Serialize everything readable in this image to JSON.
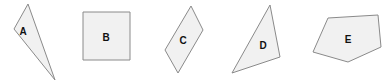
{
  "diagram": {
    "colors": {
      "fill": "#f1f1f1",
      "stroke": "#8a8a8a",
      "label": "#111111",
      "background": "#ffffff"
    },
    "shapes": [
      {
        "label": "A",
        "type": "triangle",
        "points": "28,4 14,29 55,80",
        "label_pos": [
          23,
          31
        ]
      },
      {
        "label": "B",
        "type": "square",
        "points": "83,12 130,12 130,60 83,60",
        "label_pos": [
          106,
          37
        ]
      },
      {
        "label": "C",
        "type": "parallelogram",
        "points": "191,6 203,30 178,73 165,50",
        "label_pos": [
          183,
          40
        ]
      },
      {
        "label": "D",
        "type": "triangle",
        "points": "270,5 280,57 232,73",
        "label_pos": [
          263,
          45
        ]
      },
      {
        "label": "E",
        "type": "pentagon",
        "points": "328,18 378,15 381,47 348,62 313,52",
        "label_pos": [
          348,
          39
        ]
      }
    ]
  }
}
